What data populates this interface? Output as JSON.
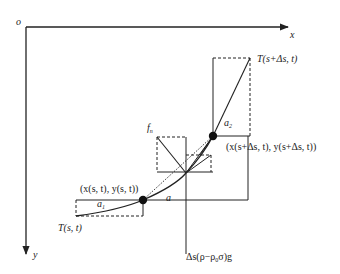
{
  "diagram": {
    "type": "force-diagram",
    "axes": {
      "origin_label": "o",
      "x_label": "x",
      "y_label": "y"
    },
    "labels": {
      "tension_end": "T(s+Δs, t)",
      "tension_start": "T(s, t)",
      "angle_2": "a",
      "angle_2_sub": "2",
      "angle_1": "a",
      "angle_1_sub": "1",
      "angle": "a",
      "normal_force": "f",
      "normal_force_sub": "n",
      "point_start": "(x(s, t), y(s, t))",
      "point_end": "(x(s+Δs, t), y(s+Δs, t))",
      "gravity_prefix": "Δs(ρ−ρ",
      "gravity_sub": "0",
      "gravity_suffix": "σ)g"
    },
    "colors": {
      "line": "#222222",
      "background": "#ffffff"
    }
  }
}
